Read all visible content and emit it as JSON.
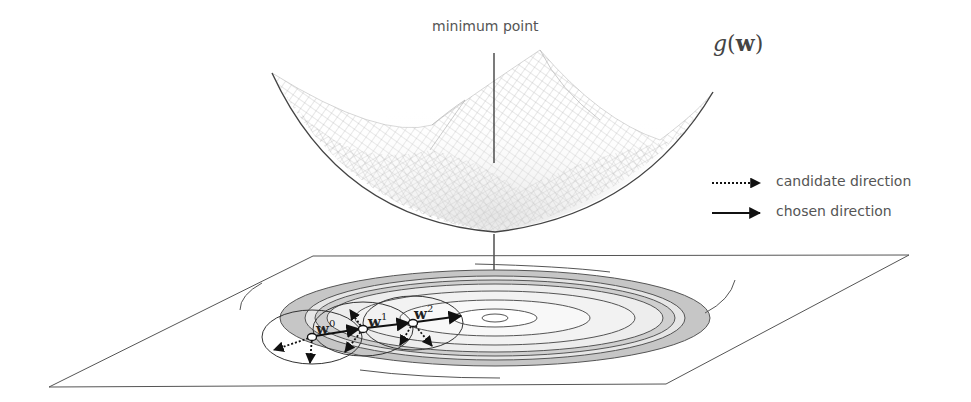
{
  "figure": {
    "annotation_top": "minimum point",
    "function_label": {
      "func": "g",
      "open": "(",
      "arg": "w",
      "close": ")"
    },
    "legend": [
      {
        "label": "candidate direction",
        "style": "dotted-arrow"
      },
      {
        "label": "chosen direction",
        "style": "solid-arrow"
      }
    ],
    "points": [
      {
        "name": "w",
        "sup": "0"
      },
      {
        "name": "w",
        "sup": "1"
      },
      {
        "name": "w",
        "sup": "2"
      }
    ],
    "colors": {
      "line": "#333333",
      "mesh": "#9a9a9a",
      "contour_band": "#c8c8c8",
      "contour_fill": "#ececec",
      "text": "#555555"
    }
  }
}
